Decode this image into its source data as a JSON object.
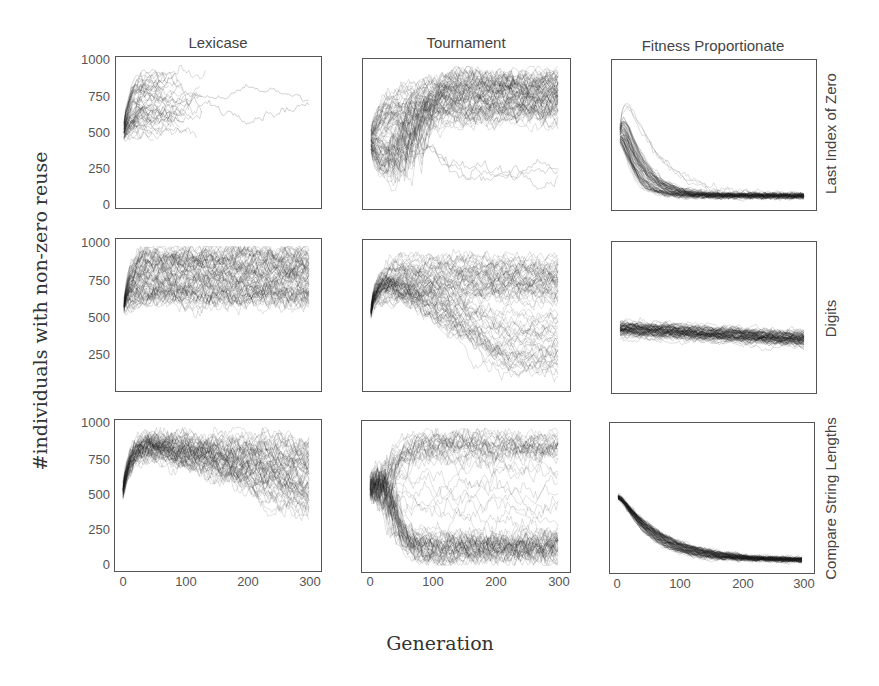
{
  "chart_data": {
    "type": "line",
    "title": "",
    "xlabel": "Generation",
    "ylabel": "#individuals with non-zero reuse",
    "xlim": [
      0,
      300
    ],
    "ylim": [
      0,
      1000
    ],
    "x_ticks": [
      "0",
      "100",
      "200",
      "300"
    ],
    "y_ticks": [
      "0",
      "250",
      "500",
      "750",
      "1000"
    ],
    "grid": false,
    "legend": null,
    "columns": [
      "Lexicase",
      "Tournament",
      "Fitness Proportionate"
    ],
    "rows": [
      "Last Index of Zero",
      "Digits",
      "Compare String Lengths"
    ],
    "panels": [
      {
        "row": "Last Index of Zero",
        "col": "Lexicase",
        "description": "runs start ~450, rise to 600-950; most runs end by gen ~130; two runs continue to 300 between 600-800",
        "start": 450,
        "band_low": 450,
        "band_high": 940,
        "end_mean": 750,
        "end_low": 650,
        "end_high": 800,
        "runs_end_early_at": 130
      },
      {
        "row": "Last Index of Zero",
        "col": "Tournament",
        "description": "start ~450, spread 100-950 early, converge to dense band ~700 (600-900); a few runs ~250",
        "start": 450,
        "band_low": 600,
        "band_high": 920,
        "end_mean": 700,
        "outlier_mean": 250
      },
      {
        "row": "Last Index of Zero",
        "col": "Fitness Proportionate",
        "description": "start ~450, peak up to ~850 early, decay to ~60 by gen 100 and stay",
        "start": 450,
        "peak": 850,
        "end_mean": 60,
        "end_low": 20,
        "end_high": 120
      },
      {
        "row": "Digits",
        "col": "Lexicase",
        "description": "start ~450, jump to ~950; band 550-970 across generations",
        "start": 450,
        "band_low": 550,
        "band_high": 970,
        "end_mean": 850
      },
      {
        "row": "Digits",
        "col": "Tournament",
        "description": "start ~450, rise to ~930, dense band ~650; many runs drift down to ~100-400 by 300",
        "start": 450,
        "band_low": 100,
        "band_high": 950,
        "end_mean": 650,
        "lower_group_end": 150
      },
      {
        "row": "Digits",
        "col": "Fitness Proportionate",
        "description": "flat band starting ~420 drifting slightly down to ~350 at gen 300",
        "start": 420,
        "end_mean": 350,
        "band_low": 150,
        "band_high": 480
      },
      {
        "row": "Compare String Lengths",
        "col": "Lexicase",
        "description": "start ~450, rise to ~900, gradual spread downward to 350-950 by gen 300",
        "start": 450,
        "band_low": 150,
        "band_high": 960,
        "end_mean": 700
      },
      {
        "row": "Compare String Lengths",
        "col": "Tournament",
        "description": "start ~550, bimodal: dense band ~120 and band ~880, scattered intermediates",
        "start": 550,
        "upper_band": 880,
        "lower_band": 120
      },
      {
        "row": "Compare String Lengths",
        "col": "Fitness Proportionate",
        "description": "start ~500, exponential decay to ~50 by gen 200",
        "start": 500,
        "end_mean": 50,
        "decay_gen": 60
      }
    ]
  },
  "figure": {
    "column_titles": [
      "Lexicase",
      "Tournament",
      "Fitness Proportionate"
    ],
    "row_titles": [
      "Last Index of Zero",
      "Digits",
      "Compare String Lengths"
    ],
    "y_axis_label": "#individuals with non-zero reuse",
    "x_axis_label": "Generation",
    "row_yticks": [
      [
        "1000",
        "750",
        "500",
        "250",
        "0"
      ],
      [
        "1000",
        "750",
        "500",
        "250"
      ],
      [
        "1000",
        "750",
        "500",
        "250",
        "0"
      ]
    ],
    "xticks": [
      "0",
      "100",
      "200",
      "300"
    ],
    "line_color": "#1a1a1a",
    "frame_color": "#555555"
  }
}
